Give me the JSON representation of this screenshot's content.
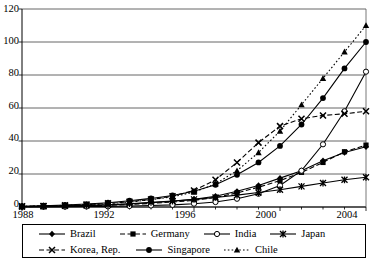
{
  "chart_data": {
    "type": "line",
    "title": "",
    "xlabel": "",
    "ylabel": "",
    "xlim": [
      1988,
      2004
    ],
    "ylim": [
      0,
      120
    ],
    "ytick_values": [
      0,
      20,
      40,
      60,
      80,
      100,
      120
    ],
    "ytick_labels": [
      "0",
      "20",
      "40",
      "60",
      "80",
      "100",
      "120"
    ],
    "xtick_values": [
      1988,
      1992,
      1996,
      2000,
      2004
    ],
    "xtick_labels": [
      "1988",
      "1992",
      "1996",
      "2000",
      "2004"
    ],
    "grid": "horizontal",
    "legend_position": "bottom",
    "x": [
      1988,
      1989,
      1990,
      1991,
      1992,
      1993,
      1994,
      1995,
      1996,
      1997,
      1998,
      1999,
      2000,
      2001,
      2002,
      2003,
      2004
    ],
    "series": [
      {
        "name": "Brazil",
        "marker": "diamond",
        "line": "solid",
        "color": "#000000",
        "values": [
          0.3,
          0.4,
          0.6,
          0.8,
          1.2,
          1.8,
          2.6,
          3.5,
          4.6,
          6.5,
          9.5,
          13.0,
          17.5,
          22.0,
          28.0,
          33.0,
          36.5
        ]
      },
      {
        "name": "Germany",
        "marker": "square",
        "line": "dashed",
        "color": "#000000",
        "values": [
          0.2,
          0.3,
          0.5,
          0.7,
          1.0,
          1.5,
          2.2,
          3.0,
          4.0,
          5.8,
          8.5,
          12.0,
          16.0,
          21.0,
          27.0,
          33.5,
          37.5
        ]
      },
      {
        "name": "India",
        "marker": "open-circle",
        "line": "solid",
        "color": "#000000",
        "values": [
          0.1,
          0.1,
          0.2,
          0.3,
          0.4,
          0.6,
          0.9,
          1.3,
          2.0,
          3.0,
          5.0,
          8.0,
          13.0,
          22.0,
          38.0,
          58.0,
          82.0
        ]
      },
      {
        "name": "Japan",
        "marker": "asterisk",
        "line": "solid",
        "color": "#000000",
        "values": [
          0.3,
          0.5,
          0.7,
          1.0,
          1.4,
          2.0,
          2.8,
          3.6,
          4.6,
          5.8,
          7.2,
          8.8,
          10.5,
          12.5,
          14.5,
          16.5,
          18.0
        ]
      },
      {
        "name": "Korea, Rep.",
        "marker": "x",
        "line": "dashed",
        "color": "#000000",
        "values": [
          0.4,
          0.6,
          1.0,
          1.5,
          2.2,
          3.2,
          4.6,
          6.5,
          10.0,
          16.5,
          27.0,
          39.0,
          49.0,
          53.5,
          55.5,
          56.5,
          58.0
        ]
      },
      {
        "name": "Singapore",
        "marker": "filled-circle",
        "line": "solid",
        "color": "#000000",
        "values": [
          0.5,
          0.8,
          1.2,
          1.8,
          2.6,
          3.8,
          5.2,
          7.0,
          9.5,
          13.5,
          19.5,
          27.0,
          37.0,
          50.0,
          66.0,
          84.0,
          100.0
        ]
      },
      {
        "name": "Chile",
        "marker": "triangle",
        "line": "dotted",
        "color": "#000000",
        "values": [
          0.4,
          0.6,
          0.9,
          1.4,
          2.0,
          3.0,
          4.4,
          6.2,
          9.0,
          14.0,
          22.0,
          33.0,
          46.0,
          62.0,
          78.0,
          94.0,
          110.0
        ]
      }
    ]
  },
  "legend": {
    "row1": [
      {
        "label": "Brazil",
        "key": "brazil-key"
      },
      {
        "label": "Germany",
        "key": "germany-key"
      },
      {
        "label": "India",
        "key": "india-key"
      },
      {
        "label": "Japan",
        "key": "japan-key"
      }
    ],
    "row2": [
      {
        "label": "Korea, Rep.",
        "key": "korea-key"
      },
      {
        "label": "Singapore",
        "key": "singapore-key"
      },
      {
        "label": "Chile",
        "key": "chile-key"
      }
    ]
  }
}
